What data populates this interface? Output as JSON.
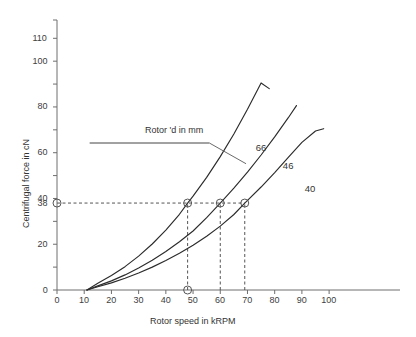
{
  "chart_data": {
    "type": "line",
    "title": "",
    "xlabel": "Rotor speed in kRPM",
    "ylabel": "Centrifugal force in cN",
    "xlim": [
      0,
      104
    ],
    "ylim": [
      0,
      118
    ],
    "grid": false,
    "legend_position": "inline-curve-labels",
    "x_ticks": [
      0,
      10,
      20,
      30,
      40,
      50,
      60,
      70,
      80,
      90,
      100
    ],
    "x_tick_labels": [
      "0",
      "10",
      "20",
      "30",
      "40",
      "50",
      "60",
      "70",
      "80",
      "90",
      "100"
    ],
    "y_ticks": [
      0,
      10,
      20,
      30,
      40,
      50,
      60,
      70,
      80,
      90,
      100,
      110
    ],
    "y_tick_labels_major": [
      "0",
      "20",
      "40",
      "60",
      "80",
      "100",
      "110"
    ],
    "y_major_values": [
      0,
      20,
      40,
      60,
      80,
      100,
      110
    ],
    "y_minor_values": [
      10,
      30,
      50,
      70,
      90
    ],
    "y_special_label": "38",
    "y_special_value": 38,
    "annotation": {
      "text": "Rotor 'd in mm",
      "underline": true,
      "leader_from": [
        56,
        71
      ],
      "leader_to": [
        68,
        53
      ]
    },
    "series": [
      {
        "name": "66",
        "label": "66",
        "rotor_diameter_mm": 66,
        "label_at": [
          73,
          62
        ],
        "x_start": 11,
        "x_end": 78,
        "y_end": 88,
        "marker_x": 48,
        "marker_y": 38,
        "points": [
          {
            "x": 11,
            "y": 0
          },
          {
            "x": 15,
            "y": 2.9
          },
          {
            "x": 20,
            "y": 6.3
          },
          {
            "x": 25,
            "y": 10.2
          },
          {
            "x": 30,
            "y": 14.8
          },
          {
            "x": 35,
            "y": 20.1
          },
          {
            "x": 40,
            "y": 26.2
          },
          {
            "x": 45,
            "y": 33.1
          },
          {
            "x": 48,
            "y": 38.0
          },
          {
            "x": 50,
            "y": 41.0
          },
          {
            "x": 55,
            "y": 49.2
          },
          {
            "x": 60,
            "y": 58.3
          },
          {
            "x": 65,
            "y": 68.2
          },
          {
            "x": 70,
            "y": 79.0
          },
          {
            "x": 75,
            "y": 90.5
          },
          {
            "x": 78,
            "y": 88.0
          }
        ]
      },
      {
        "name": "46",
        "label": "46",
        "rotor_diameter_mm": 46,
        "label_at": [
          83,
          54
        ],
        "x_start": 11,
        "x_end": 88,
        "y_end": 81,
        "marker_x": 60,
        "marker_y": 38,
        "points": [
          {
            "x": 11,
            "y": 0
          },
          {
            "x": 15,
            "y": 1.8
          },
          {
            "x": 20,
            "y": 4.0
          },
          {
            "x": 25,
            "y": 6.6
          },
          {
            "x": 30,
            "y": 9.6
          },
          {
            "x": 35,
            "y": 13.0
          },
          {
            "x": 40,
            "y": 16.8
          },
          {
            "x": 45,
            "y": 21.1
          },
          {
            "x": 50,
            "y": 25.8
          },
          {
            "x": 55,
            "y": 31.6
          },
          {
            "x": 60,
            "y": 38.0
          },
          {
            "x": 65,
            "y": 44.5
          },
          {
            "x": 70,
            "y": 51.5
          },
          {
            "x": 75,
            "y": 59.0
          },
          {
            "x": 80,
            "y": 66.9
          },
          {
            "x": 85,
            "y": 75.3
          },
          {
            "x": 88,
            "y": 80.6
          }
        ]
      },
      {
        "name": "40",
        "label": "40",
        "rotor_diameter_mm": 40,
        "label_at": [
          91,
          44
        ],
        "x_start": 11,
        "x_end": 98,
        "y_end": 70,
        "marker_x": 69,
        "marker_y": 38,
        "points": [
          {
            "x": 11,
            "y": 0
          },
          {
            "x": 15,
            "y": 1.4
          },
          {
            "x": 20,
            "y": 3.1
          },
          {
            "x": 25,
            "y": 5.1
          },
          {
            "x": 30,
            "y": 7.4
          },
          {
            "x": 35,
            "y": 10.0
          },
          {
            "x": 40,
            "y": 12.9
          },
          {
            "x": 45,
            "y": 16.1
          },
          {
            "x": 50,
            "y": 19.6
          },
          {
            "x": 55,
            "y": 23.5
          },
          {
            "x": 60,
            "y": 27.9
          },
          {
            "x": 65,
            "y": 33.0
          },
          {
            "x": 69,
            "y": 38.0
          },
          {
            "x": 75,
            "y": 45.0
          },
          {
            "x": 80,
            "y": 51.3
          },
          {
            "x": 85,
            "y": 58.0
          },
          {
            "x": 90,
            "y": 64.5
          },
          {
            "x": 95,
            "y": 69.5
          },
          {
            "x": 98,
            "y": 70.5
          }
        ]
      }
    ],
    "markers": [
      {
        "x": 48,
        "y": 38,
        "on": "66"
      },
      {
        "x": 60,
        "y": 38,
        "on": "46"
      },
      {
        "x": 69,
        "y": 38,
        "on": "40"
      },
      {
        "x": 0,
        "y": 38,
        "on": "y-axis"
      },
      {
        "x": 48,
        "y": 0,
        "on": "x-axis"
      }
    ],
    "guide_lines": [
      {
        "type": "horizontal",
        "value": 38,
        "from_x": 0,
        "to_x": 69,
        "style": "dashed"
      },
      {
        "type": "vertical",
        "value": 48,
        "from_y": 0,
        "to_y": 38,
        "style": "dashed"
      },
      {
        "type": "vertical",
        "value": 60,
        "from_y": 0,
        "to_y": 38,
        "style": "dashed"
      },
      {
        "type": "vertical",
        "value": 69,
        "from_y": 0,
        "to_y": 38,
        "style": "dashed"
      }
    ]
  },
  "colors": {
    "background": "#ffffff",
    "curve": "#2b2b2b",
    "axis": "#6e6e6e",
    "dashed": "#555555",
    "text": "#333333",
    "marker_stroke": "#555555"
  }
}
